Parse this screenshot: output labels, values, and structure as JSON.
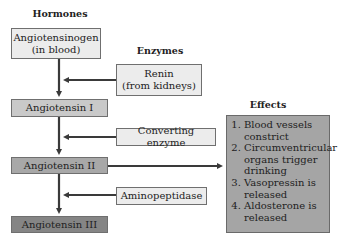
{
  "headings": {
    "hormones": "Hormones",
    "enzymes": "Enzymes",
    "effects": "Effects"
  },
  "hormones": [
    {
      "line1": "Angiotensinogen",
      "line2": "(in blood)"
    },
    {
      "line1": "Angiotensin I"
    },
    {
      "line1": "Angiotensin II"
    },
    {
      "line1": "Angiotensin III"
    }
  ],
  "enzymes": [
    {
      "line1": "Renin",
      "line2": "(from kidneys)"
    },
    {
      "line1": "Converting enzyme"
    },
    {
      "line1": "Aminopeptidase"
    }
  ],
  "effects": [
    "Blood vessels constrict",
    "Circumventricular organs trigger drinking",
    "Vasopressin is released",
    "Aldosterone is released"
  ],
  "colors": {
    "arrow": "#3a3a3a",
    "box_light": "#ececec",
    "box_mid": "#c9c9c9",
    "box_dark": "#858585",
    "effects_box": "#a5a5a5"
  }
}
